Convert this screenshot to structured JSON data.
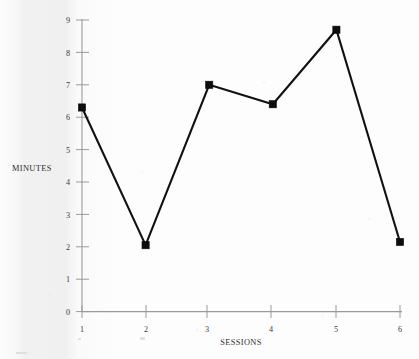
{
  "chart_data": {
    "type": "line",
    "title": "",
    "xlabel": "SESSIONS",
    "ylabel": "MINUTES",
    "x": [
      1,
      2,
      3,
      4,
      5,
      6
    ],
    "values": [
      6.3,
      2.05,
      7.0,
      6.4,
      8.7,
      2.15
    ],
    "categories": [
      "1",
      "2",
      "3",
      "4",
      "5",
      "6"
    ],
    "xlim": [
      1,
      6
    ],
    "ylim": [
      0,
      9
    ],
    "y_ticks": [
      0,
      1,
      2,
      3,
      4,
      5,
      6,
      7,
      8,
      9
    ],
    "y_tick_labels": [
      "0",
      "1",
      "2",
      "3",
      "4",
      "5",
      "6",
      "7",
      "8",
      "9"
    ],
    "x_ticks": [
      1,
      2,
      3,
      4,
      5,
      6
    ],
    "x_tick_labels": [
      "1",
      "2",
      "3",
      "4",
      "5",
      "6"
    ],
    "grid": false,
    "legend": false,
    "marker": "square",
    "series": [
      {
        "name": "minutes",
        "values": [
          6.3,
          2.05,
          7.0,
          6.4,
          8.7,
          2.15
        ]
      }
    ]
  },
  "axes": {
    "y_axis_title": "MINUTES",
    "x_axis_title": "SESSIONS"
  },
  "colors": {
    "line": "#111111",
    "marker": "#0d0d0d",
    "axis": "#9a9a9a",
    "text": "#3b3b3b",
    "background": "#fdfdfd"
  }
}
